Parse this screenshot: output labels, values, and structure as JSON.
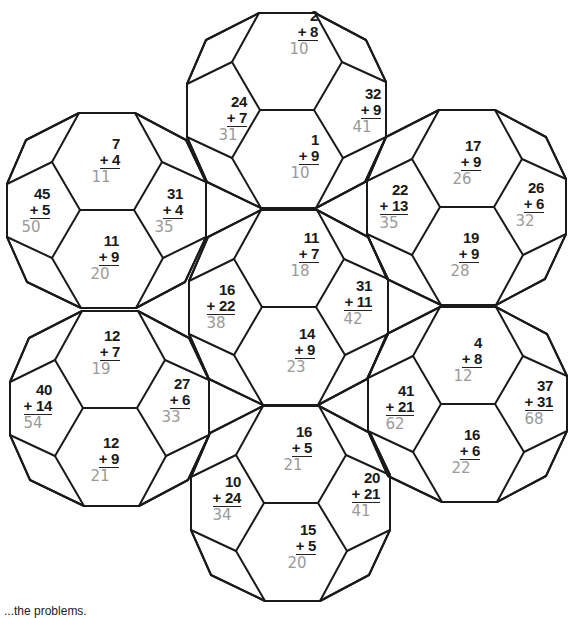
{
  "worksheet": {
    "balls": [
      {
        "id": "top",
        "cx": 287,
        "cy": 110
      },
      {
        "id": "left-upper",
        "cx": 107,
        "cy": 210
      },
      {
        "id": "right-upper",
        "cx": 467,
        "cy": 207
      },
      {
        "id": "center",
        "cx": 289,
        "cy": 307
      },
      {
        "id": "left-lower",
        "cx": 110,
        "cy": 408
      },
      {
        "id": "right-lower",
        "cx": 468,
        "cy": 404
      },
      {
        "id": "bottom",
        "cx": 291,
        "cy": 503
      }
    ],
    "problems": [
      {
        "a": "2",
        "op": "+ 8",
        "answer": "10",
        "x": 258,
        "y": 8
      },
      {
        "a": "24",
        "op": "+ 7",
        "answer": "31",
        "x": 187,
        "y": 94
      },
      {
        "a": "32",
        "op": "+ 9",
        "answer": "41",
        "x": 321,
        "y": 86
      },
      {
        "a": "1",
        "op": "+ 9",
        "answer": "10",
        "x": 259,
        "y": 132
      },
      {
        "a": "7",
        "op": "+ 4",
        "answer": "11",
        "x": 60,
        "y": 136
      },
      {
        "a": "45",
        "op": "+ 5",
        "answer": "50",
        "x": -10,
        "y": 186
      },
      {
        "a": "31",
        "op": "+ 4",
        "answer": "35",
        "x": 123,
        "y": 186
      },
      {
        "a": "11",
        "op": "+ 9",
        "answer": "20",
        "x": 59,
        "y": 233
      },
      {
        "a": "17",
        "op": "+ 9",
        "answer": "26",
        "x": 421,
        "y": 138
      },
      {
        "a": "22",
        "op": "+ 13",
        "answer": "35",
        "x": 348,
        "y": 182
      },
      {
        "a": "26",
        "op": "+ 6",
        "answer": "32",
        "x": 484,
        "y": 180
      },
      {
        "a": "19",
        "op": "+ 9",
        "answer": "28",
        "x": 419,
        "y": 230
      },
      {
        "a": "11",
        "op": "+ 7",
        "answer": "18",
        "x": 259,
        "y": 230
      },
      {
        "a": "16",
        "op": "+ 22",
        "answer": "38",
        "x": 175,
        "y": 282
      },
      {
        "a": "31",
        "op": "+ 11",
        "answer": "42",
        "x": 312,
        "y": 278
      },
      {
        "a": "14",
        "op": "+ 9",
        "answer": "23",
        "x": 255,
        "y": 326
      },
      {
        "a": "12",
        "op": "+ 7",
        "answer": "19",
        "x": 60,
        "y": 328
      },
      {
        "a": "40",
        "op": "+ 14",
        "answer": "54",
        "x": -8,
        "y": 382
      },
      {
        "a": "27",
        "op": "+ 6",
        "answer": "33",
        "x": 130,
        "y": 376
      },
      {
        "a": "12",
        "op": "+ 9",
        "answer": "21",
        "x": 59,
        "y": 435
      },
      {
        "a": "4",
        "op": "+ 8",
        "answer": "12",
        "x": 422,
        "y": 335
      },
      {
        "a": "41",
        "op": "+ 21",
        "answer": "62",
        "x": 354,
        "y": 383
      },
      {
        "a": "37",
        "op": "+ 31",
        "answer": "68",
        "x": 493,
        "y": 378
      },
      {
        "a": "16",
        "op": "+ 6",
        "answer": "22",
        "x": 420,
        "y": 427
      },
      {
        "a": "16",
        "op": "+ 5",
        "answer": "21",
        "x": 252,
        "y": 424
      },
      {
        "a": "10",
        "op": "+ 24",
        "answer": "34",
        "x": 181,
        "y": 474
      },
      {
        "a": "20",
        "op": "+ 21",
        "answer": "41",
        "x": 320,
        "y": 470
      },
      {
        "a": "15",
        "op": "+ 5",
        "answer": "20",
        "x": 256,
        "y": 522
      }
    ],
    "footer_text": "...the problems."
  },
  "colors": {
    "line": "#1a1a1a",
    "answer_pencil": "#9a9a9a",
    "background": "#ffffff"
  }
}
